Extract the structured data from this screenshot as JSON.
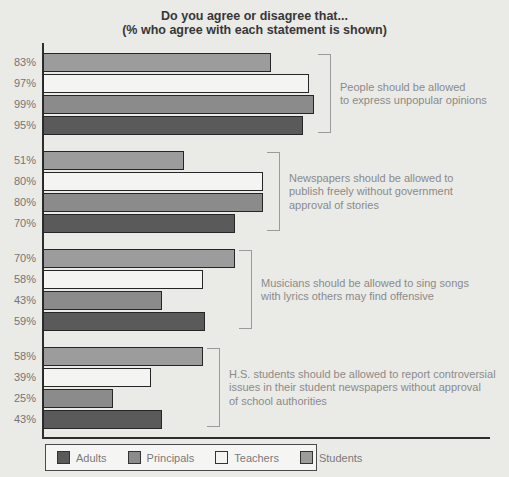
{
  "title": {
    "line1": "Do you agree or disagree that...",
    "line2": "(% who agree with each statement is shown)"
  },
  "legend": {
    "order": [
      "Adults",
      "Principals",
      "Teachers",
      "Students"
    ]
  },
  "colors": {
    "background": "#eaeae7",
    "axis": "#2e2e2e",
    "bar_border": "#262626",
    "bracket": "#9a9a9a",
    "annotation_text": "#8a8a8a",
    "value_label_text": "#757575"
  },
  "chart_data": {
    "type": "bar",
    "orientation": "horizontal",
    "title": "Do you agree or disagree that...",
    "subtitle": "(% who agree with each statement is shown)",
    "xlim": [
      0,
      100
    ],
    "value_label_format": "percent",
    "legend_position": "bottom",
    "grid": false,
    "categories": [
      "People should be allowed to express unpopular opinions",
      "Newspapers should be allowed to publish freely without government approval of stories",
      "Musicians should be allowed to sing songs with lyrics others may find offensive",
      "H.S. students should be allowed to report controversial issues in their student newspapers without approval of school authorities"
    ],
    "categories_lines": [
      [
        "People should be allowed",
        "to express unpopular opinions"
      ],
      [
        "Newspapers should be allowed to",
        "publish freely without government",
        "approval of stories"
      ],
      [
        "Musicians should be allowed to sing songs",
        "with lyrics others may find offensive"
      ],
      [
        "H.S. students should be allowed to report controversial",
        "issues in their student newspapers without approval",
        "of school authorities"
      ]
    ],
    "series": [
      {
        "name": "Adults",
        "color": "#5a5a5a",
        "values": [
          95,
          70,
          59,
          43
        ]
      },
      {
        "name": "Principals",
        "color": "#8b8b8b",
        "values": [
          99,
          80,
          43,
          25
        ]
      },
      {
        "name": "Teachers",
        "color": "#f4f4f2",
        "values": [
          97,
          80,
          58,
          39
        ]
      },
      {
        "name": "Students",
        "color": "#9c9c9c",
        "values": [
          83,
          51,
          70,
          58
        ]
      }
    ],
    "bar_order_top_to_bottom": [
      "Students",
      "Teachers",
      "Principals",
      "Adults"
    ]
  }
}
